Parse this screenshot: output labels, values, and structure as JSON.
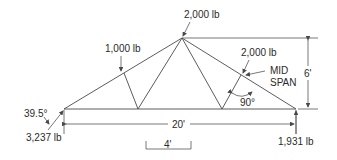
{
  "diagram": {
    "type": "truss-load-diagram",
    "loads": {
      "apex": "2,000 lb",
      "left_panel": "1,000 lb",
      "right_midspan": "2,000 lb"
    },
    "reactions": {
      "left": "3,237 lb",
      "right": "1,931 lb"
    },
    "angles": {
      "left_reaction": "39.5°",
      "right_member": "90°"
    },
    "annotations": {
      "mid_span_line1": "MID",
      "mid_span_line2": "SPAN"
    },
    "dimensions": {
      "span": "20'",
      "height": "6'",
      "panel": "4'"
    },
    "colors": {
      "line": "#4a4a4a",
      "text": "#2a2a2a",
      "background": "#ffffff"
    }
  }
}
